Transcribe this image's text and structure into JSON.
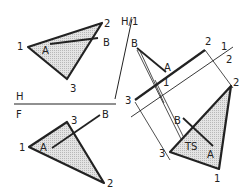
{
  "diagram": {
    "colors": {
      "line": "#222222",
      "fill": "#d9d9d9",
      "background": "#ffffff"
    },
    "fold_lines": {
      "hf": {
        "top_label": "H",
        "bottom_label": "F"
      },
      "h1": {
        "label": "H/1"
      },
      "one_two": {
        "label_1": "1",
        "label_2": "2"
      }
    },
    "top_view": {
      "v1": "1",
      "v2": "2",
      "v3": "3",
      "a": "A",
      "b": "B"
    },
    "front_view": {
      "v1": "1",
      "v2": "2",
      "v3": "3",
      "a": "A",
      "b": "B"
    },
    "aux1_view": {
      "v1": "1",
      "v2": "2",
      "v3": "3",
      "a": "A",
      "b": "B"
    },
    "aux2_view": {
      "v1": "1",
      "v2": "2",
      "v3": "3",
      "a": "A",
      "b": "B",
      "ts": "TS"
    }
  }
}
